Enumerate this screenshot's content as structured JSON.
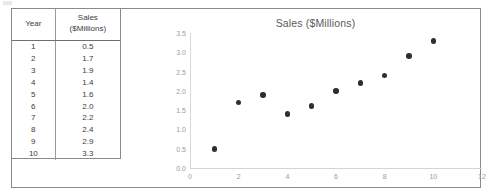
{
  "document": {
    "type": "spreadsheet-figure",
    "frame_border_color": "#8a8a8a"
  },
  "table": {
    "name": "sales-data-table",
    "headers": {
      "year": "Year",
      "sales_line1": "Sales",
      "sales_line2": "($Millions)"
    },
    "rows": [
      {
        "year": "1",
        "sales": "0.5"
      },
      {
        "year": "2",
        "sales": "1.7"
      },
      {
        "year": "3",
        "sales": "1.9"
      },
      {
        "year": "4",
        "sales": "1.4"
      },
      {
        "year": "5",
        "sales": "1.6"
      },
      {
        "year": "6",
        "sales": "2.0"
      },
      {
        "year": "7",
        "sales": "2.2"
      },
      {
        "year": "8",
        "sales": "2.4"
      },
      {
        "year": "9",
        "sales": "2.9"
      },
      {
        "year": "10",
        "sales": "3.3"
      }
    ]
  },
  "chart_data": {
    "type": "scatter",
    "title": "Sales ($Millions)",
    "xlabel": "",
    "ylabel": "",
    "x": [
      1,
      2,
      3,
      4,
      5,
      6,
      7,
      8,
      9,
      10
    ],
    "values": [
      0.5,
      1.7,
      1.9,
      1.4,
      1.6,
      2.0,
      2.2,
      2.4,
      2.9,
      3.3
    ],
    "series": [
      {
        "name": "Sales ($Millions)",
        "x": [
          1,
          2,
          3,
          4,
          5,
          6,
          7,
          8,
          9,
          10
        ],
        "values": [
          0.5,
          1.7,
          1.9,
          1.4,
          1.6,
          2.0,
          2.2,
          2.4,
          2.9,
          3.3
        ],
        "marker_color": "#2f2f2f"
      }
    ],
    "xlim": [
      0,
      12
    ],
    "ylim": [
      0.0,
      3.5
    ],
    "xticks": [
      "0",
      "2",
      "4",
      "6",
      "8",
      "10",
      "12"
    ],
    "xtick_values": [
      0,
      2,
      4,
      6,
      8,
      10,
      12
    ],
    "yticks": [
      "0.0",
      "0.5",
      "1.0",
      "1.5",
      "2.0",
      "2.5",
      "3.0",
      "3.5"
    ],
    "ytick_values": [
      0.0,
      0.5,
      1.0,
      1.5,
      2.0,
      2.5,
      3.0,
      3.5
    ],
    "grid": false,
    "legend": false,
    "legend_position": "none",
    "title_color": "#5a5a5a",
    "tick_color": "#9b9b9b"
  }
}
